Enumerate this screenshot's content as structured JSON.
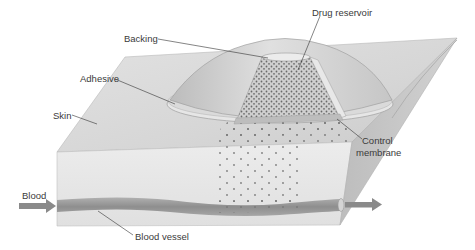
{
  "diagram": {
    "labels": {
      "drug_reservoir": "Drug reservoir",
      "backing": "Backing",
      "adhesive": "Adhesive",
      "skin": "Skin",
      "control_membrane_line1": "Control",
      "control_membrane_line2": "membrane",
      "blood": "Blood",
      "blood_vessel": "Blood vessel"
    },
    "colors": {
      "background": "#ffffff",
      "skin_top": "#dcdcdc",
      "skin_front": "#e6e6e6",
      "skin_side": "#c4c4c4",
      "patch": "#cfcfcf",
      "patch_rim": "#e4e4e4",
      "reservoir": "#c8c8c8",
      "drug_dot": "#6a6a6a",
      "vessel": "#9a9a9a",
      "arrow": "#8a8a8a",
      "leader_line": "#333333",
      "text": "#3a3a3a"
    }
  }
}
